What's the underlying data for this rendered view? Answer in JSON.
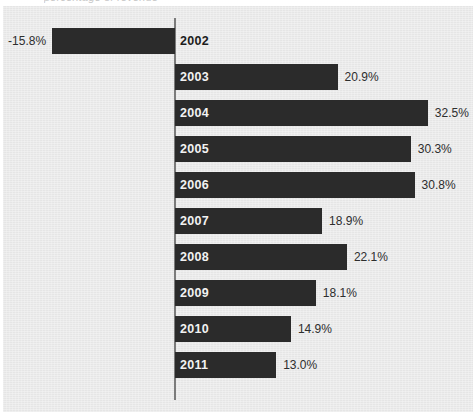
{
  "figure": {
    "clipped_caption": "percentage of revenue",
    "background_color": "#e9e9e9",
    "bar_color": "#2b2b2b",
    "axis_color": "#7b7b7b",
    "inside_label_color": "#f2f2f2",
    "value_label_color": "#2d2d2d"
  },
  "chart_data": {
    "type": "bar",
    "orientation": "horizontal",
    "title": "",
    "subtitle": "",
    "xlabel": "",
    "ylabel": "",
    "categories": [
      "2002",
      "2003",
      "2004",
      "2005",
      "2006",
      "2007",
      "2008",
      "2009",
      "2010",
      "2011"
    ],
    "values": [
      -15.8,
      20.9,
      32.5,
      30.3,
      30.8,
      18.9,
      22.1,
      18.1,
      14.9,
      13.0
    ],
    "value_labels": [
      "-15.8%",
      "20.9%",
      "32.5%",
      "30.3%",
      "30.8%",
      "18.9%",
      "22.1%",
      "18.1%",
      "14.9%",
      "13.0%"
    ],
    "xlim": [
      -16.5,
      33.5
    ],
    "grid": false,
    "legend": null,
    "zero_line": 0,
    "units": "percent",
    "bars": [
      {
        "category": "2002",
        "value": -15.8,
        "value_label": "-15.8%",
        "label_position": "outside-left",
        "year_label_position": "outside-right"
      },
      {
        "category": "2003",
        "value": 20.9,
        "value_label": "20.9%",
        "label_position": "outside-right",
        "year_label_position": "inside"
      },
      {
        "category": "2004",
        "value": 32.5,
        "value_label": "32.5%",
        "label_position": "outside-right",
        "year_label_position": "inside"
      },
      {
        "category": "2005",
        "value": 30.3,
        "value_label": "30.3%",
        "label_position": "outside-right",
        "year_label_position": "inside"
      },
      {
        "category": "2006",
        "value": 30.8,
        "value_label": "30.8%",
        "label_position": "outside-right",
        "year_label_position": "inside"
      },
      {
        "category": "2007",
        "value": 18.9,
        "value_label": "18.9%",
        "label_position": "outside-right",
        "year_label_position": "inside"
      },
      {
        "category": "2008",
        "value": 22.1,
        "value_label": "22.1%",
        "label_position": "outside-right",
        "year_label_position": "inside"
      },
      {
        "category": "2009",
        "value": 18.1,
        "value_label": "18.1%",
        "label_position": "outside-right",
        "year_label_position": "inside"
      },
      {
        "category": "2010",
        "value": 14.9,
        "value_label": "14.9%",
        "label_position": "outside-right",
        "year_label_position": "inside"
      },
      {
        "category": "2011",
        "value": 13.0,
        "value_label": "13.0%",
        "label_position": "outside-right",
        "year_label_position": "inside"
      }
    ]
  }
}
